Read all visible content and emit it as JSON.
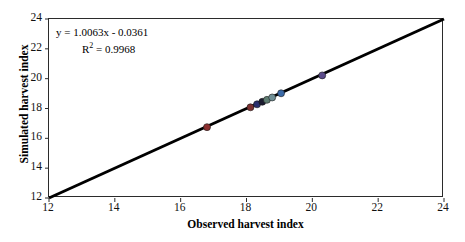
{
  "chart_data": {
    "type": "scatter",
    "title": "",
    "xlabel": "Observed harvest index",
    "ylabel": "Simulated harvest index",
    "xlim": [
      12,
      24
    ],
    "ylim": [
      12,
      24
    ],
    "xticks": [
      12,
      14,
      16,
      18,
      20,
      22,
      24
    ],
    "yticks": [
      12,
      14,
      16,
      18,
      20,
      22,
      24
    ],
    "grid": false,
    "legend": "none",
    "annotations": {
      "equation": "y = 1.0063x - 0.0361",
      "r_squared_label": "R",
      "r_squared_exponent": "2",
      "r_squared_value": "= 0.9968"
    },
    "fit": {
      "slope": 1.0063,
      "intercept": -0.0361,
      "r2": 0.9968
    },
    "reference_line": {
      "name": "one-to-one-line",
      "from": [
        12,
        12
      ],
      "to": [
        24,
        24
      ],
      "color": "#000000",
      "width": 3
    },
    "points": [
      {
        "x": 16.8,
        "y": 16.75,
        "color": "#8c2f2f",
        "label": "point-1"
      },
      {
        "x": 18.12,
        "y": 18.08,
        "color": "#7c3030",
        "label": "point-2"
      },
      {
        "x": 18.32,
        "y": 18.28,
        "color": "#2b2f6e",
        "label": "point-3"
      },
      {
        "x": 18.48,
        "y": 18.45,
        "color": "#1b1b30",
        "label": "point-4"
      },
      {
        "x": 18.62,
        "y": 18.58,
        "color": "#5f7d72",
        "label": "point-5"
      },
      {
        "x": 18.78,
        "y": 18.74,
        "color": "#6f8f96",
        "label": "point-6"
      },
      {
        "x": 19.05,
        "y": 19.02,
        "color": "#3b6aa8",
        "label": "point-7"
      },
      {
        "x": 20.3,
        "y": 20.22,
        "color": "#5b4b8a",
        "label": "point-8"
      }
    ],
    "marker": {
      "shape": "circle",
      "size": 7,
      "edge_color": "#1a1a1a"
    }
  }
}
